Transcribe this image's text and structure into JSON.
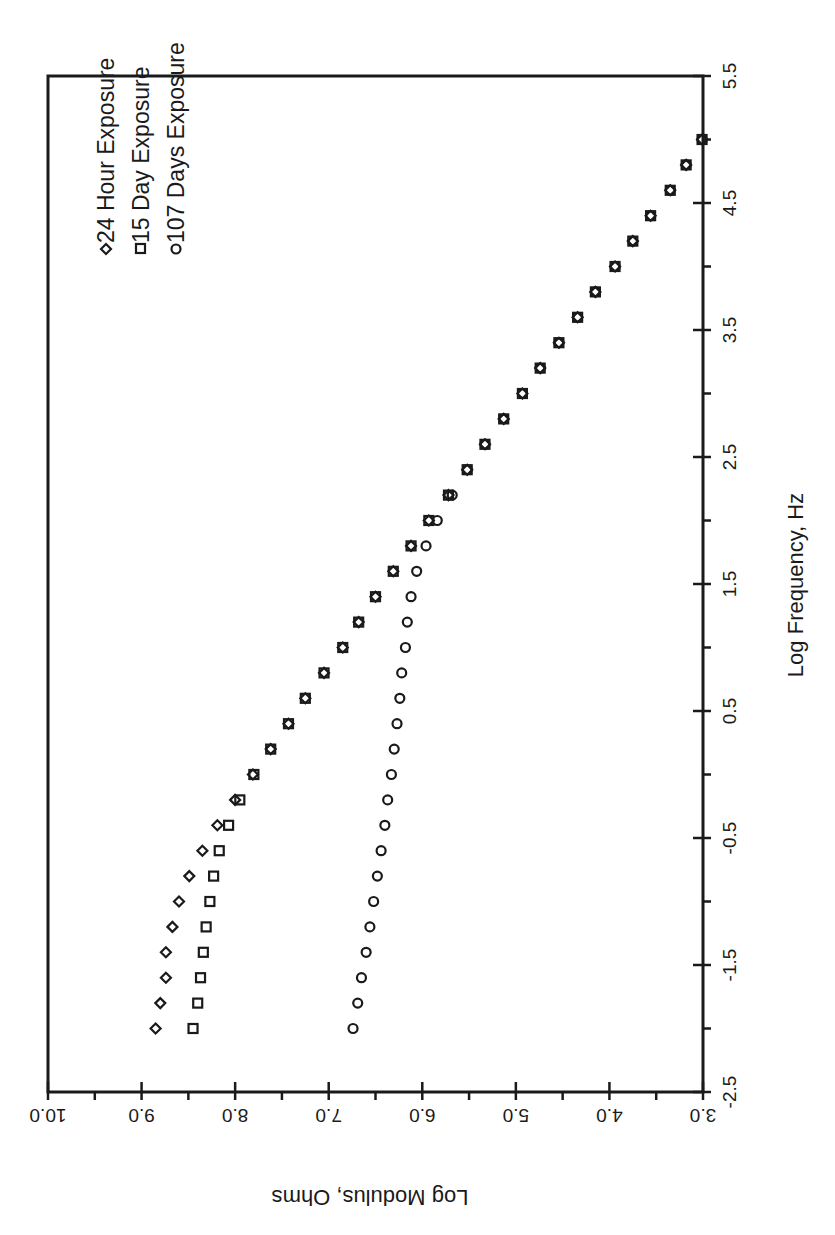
{
  "chart_data": {
    "type": "scatter",
    "orientation_note": "figure rotated 90 degrees clockwise on page",
    "title": "",
    "xlabel": "Log Frequency, Hz",
    "ylabel": "Log Modulus, Ohms",
    "xlim": [
      -2.5,
      5.5
    ],
    "ylim": [
      3.0,
      10.0
    ],
    "x_ticks": [
      "-2.5",
      "-1.5",
      "-0.5",
      "0.5",
      "1.5",
      "2.5",
      "3.5",
      "4.5",
      "5.5"
    ],
    "y_ticks": [
      "3.0",
      "4.0",
      "5.0",
      "6.0",
      "7.0",
      "8.0",
      "9.0",
      "10.0"
    ],
    "grid": false,
    "legend_position": "upper-left (inside plot)",
    "series": [
      {
        "name": "24 Hour Exposure",
        "marker": "diamond",
        "x": [
          -2.0,
          -1.8,
          -1.6,
          -1.4,
          -1.2,
          -1.0,
          -0.8,
          -0.6,
          -0.4,
          -0.2,
          0.0,
          0.2,
          0.4,
          0.6,
          0.8,
          1.0,
          1.2,
          1.4,
          1.6,
          1.8,
          2.0,
          2.2,
          2.4,
          2.6,
          2.8,
          3.0,
          3.2,
          3.4,
          3.6,
          3.8,
          4.0,
          4.2,
          4.4,
          4.6,
          4.8,
          5.0
        ],
        "values": [
          8.85,
          8.8,
          8.74,
          8.74,
          8.67,
          8.6,
          8.49,
          8.35,
          8.19,
          8.0,
          7.81,
          7.62,
          7.43,
          7.25,
          7.05,
          6.85,
          6.68,
          6.5,
          6.31,
          6.12,
          5.93,
          5.72,
          5.52,
          5.33,
          5.13,
          4.93,
          4.74,
          4.54,
          4.34,
          4.15,
          3.94,
          3.75,
          3.56,
          3.35,
          3.18,
          3.01
        ]
      },
      {
        "name": "15 Day Exposure",
        "marker": "square",
        "x": [
          -2.0,
          -1.8,
          -1.6,
          -1.4,
          -1.2,
          -1.0,
          -0.8,
          -0.6,
          -0.4,
          -0.2,
          0.0,
          0.2,
          0.4,
          0.6,
          0.8,
          1.0,
          1.2,
          1.4,
          1.6,
          1.8,
          2.0,
          2.2,
          2.4,
          2.6,
          2.8,
          3.0,
          3.2,
          3.4,
          3.6,
          3.8,
          4.0,
          4.2,
          4.4,
          4.6,
          4.8,
          5.0
        ],
        "values": [
          8.45,
          8.4,
          8.37,
          8.34,
          8.31,
          8.27,
          8.23,
          8.17,
          8.07,
          7.95,
          7.8,
          7.62,
          7.43,
          7.25,
          7.05,
          6.85,
          6.68,
          6.5,
          6.31,
          6.12,
          5.93,
          5.72,
          5.52,
          5.33,
          5.13,
          4.93,
          4.74,
          4.54,
          4.34,
          4.15,
          3.94,
          3.75,
          3.56,
          3.35,
          3.18,
          3.01
        ]
      },
      {
        "name": "107 Days Exposure",
        "marker": "circle",
        "x": [
          -2.0,
          -1.8,
          -1.6,
          -1.4,
          -1.2,
          -1.0,
          -0.8,
          -0.6,
          -0.4,
          -0.2,
          0.0,
          0.2,
          0.4,
          0.6,
          0.8,
          1.0,
          1.2,
          1.4,
          1.6,
          1.8,
          2.0,
          2.2,
          2.4,
          2.6,
          2.8,
          3.0,
          3.2,
          3.4,
          3.6,
          3.8,
          4.0,
          4.2,
          4.4,
          4.6,
          4.8,
          5.0
        ],
        "values": [
          6.74,
          6.69,
          6.65,
          6.6,
          6.56,
          6.52,
          6.48,
          6.44,
          6.4,
          6.37,
          6.33,
          6.3,
          6.27,
          6.24,
          6.22,
          6.18,
          6.16,
          6.12,
          6.06,
          5.96,
          5.84,
          5.68,
          5.52,
          5.33,
          5.13,
          4.93,
          4.74,
          4.54,
          4.34,
          4.15,
          3.94,
          3.75,
          3.56,
          3.35,
          3.18,
          3.01
        ]
      }
    ]
  },
  "legend": {
    "items": [
      {
        "label": "24 Hour Exposure",
        "marker": "diamond-icon"
      },
      {
        "label": "15 Day Exposure",
        "marker": "square-icon"
      },
      {
        "label": "107 Days Exposure",
        "marker": "circle-icon"
      }
    ]
  },
  "axes": {
    "frequency_title": "Log Frequency, Hz",
    "modulus_title": "Log Modulus, Ohms"
  },
  "colors": {
    "ink": "#1a1a1a",
    "background": "#ffffff"
  }
}
